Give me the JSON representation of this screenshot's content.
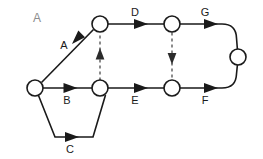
{
  "figure": {
    "panel_label": "A",
    "type": "activity-on-arrow-network-diagram",
    "width": 263,
    "height": 159,
    "background_color": "#ffffff",
    "line_color": "#1a1a1a",
    "dashed_line_color": "#4d4d4d",
    "panel_label_color": "#8c8c8c"
  },
  "nodes": [
    {
      "id": "n1",
      "cx": 35,
      "cy": 88,
      "r": 8
    },
    {
      "id": "n2",
      "cx": 100,
      "cy": 24,
      "r": 8
    },
    {
      "id": "n3",
      "cx": 100,
      "cy": 88,
      "r": 8
    },
    {
      "id": "n4",
      "cx": 172,
      "cy": 24,
      "r": 8
    },
    {
      "id": "n5",
      "cx": 172,
      "cy": 88,
      "r": 8
    },
    {
      "id": "n6",
      "cx": 238,
      "cy": 57,
      "r": 8
    }
  ],
  "edges": [
    {
      "id": "edge-a",
      "label": "A",
      "from": "n1",
      "to": "n2",
      "style": "solid",
      "label_x": 64,
      "label_y": 46
    },
    {
      "id": "edge-b",
      "label": "B",
      "from": "n1",
      "to": "n3",
      "style": "solid",
      "label_x": 67,
      "label_y": 101
    },
    {
      "id": "edge-c",
      "label": "C",
      "from": "n1",
      "to": "n3",
      "style": "solid",
      "label_x": 70,
      "label_y": 150
    },
    {
      "id": "edge-d",
      "label": "D",
      "from": "n2",
      "to": "n4",
      "style": "solid",
      "label_x": 135,
      "label_y": 13
    },
    {
      "id": "edge-e",
      "label": "E",
      "from": "n3",
      "to": "n5",
      "style": "solid",
      "label_x": 135,
      "label_y": 101
    },
    {
      "id": "edge-f",
      "label": "F",
      "from": "n5",
      "to": "n6",
      "style": "solid",
      "label_x": 205,
      "label_y": 101
    },
    {
      "id": "edge-g",
      "label": "G",
      "from": "n4",
      "to": "n6",
      "style": "solid",
      "label_x": 205,
      "label_y": 13
    },
    {
      "id": "edge-dummy-left",
      "label": "",
      "from": "n3",
      "to": "n2",
      "style": "dashed",
      "direction": "up"
    },
    {
      "id": "edge-dummy-right",
      "label": "",
      "from": "n4",
      "to": "n5",
      "style": "dashed",
      "direction": "down"
    }
  ],
  "labels": {
    "panel": "A",
    "a": "A",
    "b": "B",
    "c": "C",
    "d": "D",
    "e": "E",
    "f": "F",
    "g": "G"
  }
}
